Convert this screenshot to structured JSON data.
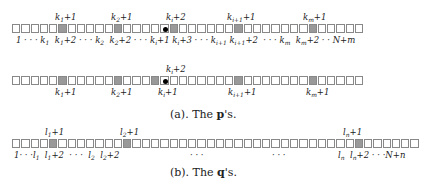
{
  "figure_a": {
    "caption": "(a).  The p's.",
    "caption_prefix": "(a).  The ",
    "caption_bold": "p",
    "caption_suffix": "'s.",
    "row1": {
      "cells": 38,
      "gray": [
        5,
        11,
        18,
        24,
        32
      ],
      "dot": 17,
      "labels_above": [
        "k1+1",
        "k2+1",
        "ki+2",
        "ki+1 +1",
        "km+1"
      ],
      "labels_below": [
        "1",
        "k1",
        "k1+2",
        "k2",
        "k2+2",
        "ki+1",
        "ki+3",
        "ki+1",
        "ki+1+2",
        "km",
        "km+2",
        "N+m"
      ]
    },
    "row2": {
      "cells": 38,
      "gray": [
        5,
        11,
        16,
        24,
        32
      ],
      "dot": 17,
      "labels_above": [
        "ki+2"
      ],
      "labels_below": [
        "k1+1",
        "k2+1",
        "ki+1",
        "ki+1 +1",
        "km+1"
      ]
    }
  },
  "figure_b": {
    "caption": "(b).  The q's.",
    "caption_prefix": "(b).  The ",
    "caption_bold": "q",
    "caption_suffix": "'s.",
    "row": {
      "cells": 43,
      "gray": [
        4,
        12,
        36
      ],
      "labels_above": [
        "l1+1",
        "l2+1",
        "ln+1"
      ],
      "labels_below": [
        "1",
        "l1",
        "l1+2",
        "l2",
        "l2+2",
        "ln",
        "ln+2",
        "N+n"
      ]
    }
  }
}
